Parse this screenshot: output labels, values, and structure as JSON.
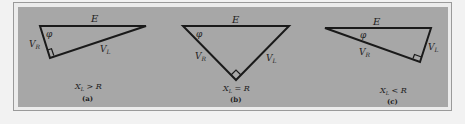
{
  "figure": {
    "panels": [
      {
        "id": "a",
        "caption": "(a)",
        "condition": {
          "lhs": "X",
          "sub": "L",
          "op": " > ",
          "rhs": "R"
        },
        "labels": {
          "E": "E",
          "phi": "φ",
          "VR": {
            "base": "V",
            "sub": "R"
          },
          "VL": {
            "base": "V",
            "sub": "L"
          }
        }
      },
      {
        "id": "b",
        "caption": "(b)",
        "condition": {
          "lhs": "X",
          "sub": "L",
          "op": " = ",
          "rhs": "R"
        },
        "labels": {
          "E": "E",
          "phi": "φ",
          "VR": {
            "base": "V",
            "sub": "R"
          },
          "VL": {
            "base": "V",
            "sub": "L"
          }
        }
      },
      {
        "id": "c",
        "caption": "(c)",
        "condition": {
          "lhs": "X",
          "sub": "L",
          "op": " < ",
          "rhs": "R"
        },
        "labels": {
          "E": "E",
          "phi": "φ",
          "VR": {
            "base": "V",
            "sub": "R"
          },
          "VL": {
            "base": "V",
            "sub": "L"
          }
        }
      }
    ],
    "colors": {
      "panel": "#a7a7a7",
      "line": "#1a1a1a",
      "frame": "#9a9a9a"
    }
  }
}
